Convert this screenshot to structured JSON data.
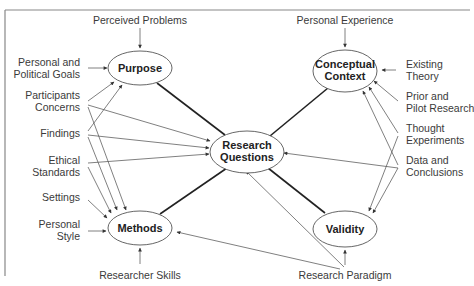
{
  "diagram": {
    "title": "",
    "nodes": {
      "purpose": {
        "label": "Purpose"
      },
      "conceptual_context": {
        "line1": "Conceptual",
        "line2": "Context"
      },
      "research_questions": {
        "line1": "Research",
        "line2": "Questions"
      },
      "methods": {
        "label": "Methods"
      },
      "validity": {
        "label": "Validity"
      }
    },
    "inputs": {
      "perceived_problems": "Perceived Problems",
      "personal_political_goals": {
        "line1": "Personal and",
        "line2": "Political Goals"
      },
      "participants_concerns": {
        "line1": "Participants",
        "line2": "Concerns"
      },
      "findings": "Findings",
      "ethical_standards": {
        "line1": "Ethical",
        "line2": "Standards"
      },
      "settings": "Settings",
      "personal_style": {
        "line1": "Personal",
        "line2": "Style"
      },
      "researcher_skills": "Researcher Skills",
      "personal_experience": "Personal Experience",
      "existing_theory": {
        "line1": "Existing",
        "line2": "Theory"
      },
      "prior_pilot_research": {
        "line1": "Prior and",
        "line2": "Pilot Research"
      },
      "thought_experiments": {
        "line1": "Thought",
        "line2": "Experiments"
      },
      "data_conclusions": {
        "line1": "Data and",
        "line2": "Conclusions"
      },
      "research_paradigm": "Research Paradigm"
    },
    "edges": [
      {
        "from": "Perceived Problems",
        "to": "Purpose"
      },
      {
        "from": "Personal and Political Goals",
        "to": "Purpose"
      },
      {
        "from": "Participants Concerns",
        "to": "Purpose"
      },
      {
        "from": "Participants Concerns",
        "to": "Research Questions"
      },
      {
        "from": "Participants Concerns",
        "to": "Methods"
      },
      {
        "from": "Findings",
        "to": "Purpose"
      },
      {
        "from": "Findings",
        "to": "Research Questions"
      },
      {
        "from": "Findings",
        "to": "Methods"
      },
      {
        "from": "Ethical Standards",
        "to": "Research Questions"
      },
      {
        "from": "Ethical Standards",
        "to": "Methods"
      },
      {
        "from": "Settings",
        "to": "Methods"
      },
      {
        "from": "Personal Style",
        "to": "Methods"
      },
      {
        "from": "Researcher Skills",
        "to": "Methods"
      },
      {
        "from": "Personal Experience",
        "to": "Conceptual Context"
      },
      {
        "from": "Existing Theory",
        "to": "Conceptual Context"
      },
      {
        "from": "Prior and Pilot Research",
        "to": "Conceptual Context"
      },
      {
        "from": "Thought Experiments",
        "to": "Conceptual Context"
      },
      {
        "from": "Thought Experiments",
        "to": "Validity"
      },
      {
        "from": "Data and Conclusions",
        "to": "Conceptual Context"
      },
      {
        "from": "Data and Conclusions",
        "to": "Research Questions"
      },
      {
        "from": "Data and Conclusions",
        "to": "Validity"
      },
      {
        "from": "Research Paradigm",
        "to": "Research Questions"
      },
      {
        "from": "Research Paradigm",
        "to": "Methods"
      },
      {
        "from": "Research Paradigm",
        "to": "Validity"
      }
    ],
    "links": [
      {
        "a": "Purpose",
        "b": "Research Questions"
      },
      {
        "a": "Conceptual Context",
        "b": "Research Questions"
      },
      {
        "a": "Methods",
        "b": "Research Questions"
      },
      {
        "a": "Validity",
        "b": "Research Questions"
      }
    ]
  }
}
